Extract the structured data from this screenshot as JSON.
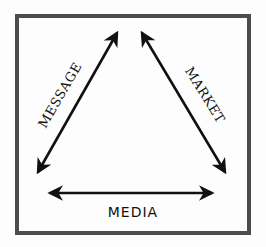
{
  "diagram": {
    "type": "triangle-relationship",
    "frame": {
      "color": "#4d4d4d",
      "stroke_width": 4
    },
    "arrow_color": "#111111",
    "nodes": [
      {
        "id": "message",
        "label": "MESSAGE",
        "position": "left-side"
      },
      {
        "id": "market",
        "label": "MARKET",
        "position": "right-side"
      },
      {
        "id": "media",
        "label": "MEDIA",
        "position": "bottom-side"
      }
    ],
    "edges": [
      {
        "side": "left",
        "label": "MESSAGE",
        "direction": "bidirectional"
      },
      {
        "side": "right",
        "label": "MARKET",
        "direction": "bidirectional"
      },
      {
        "side": "bottom",
        "label": "MEDIA",
        "direction": "bidirectional"
      }
    ]
  },
  "labels": {
    "message": "MESSAGE",
    "market": "MARKET",
    "media": "MEDIA"
  }
}
